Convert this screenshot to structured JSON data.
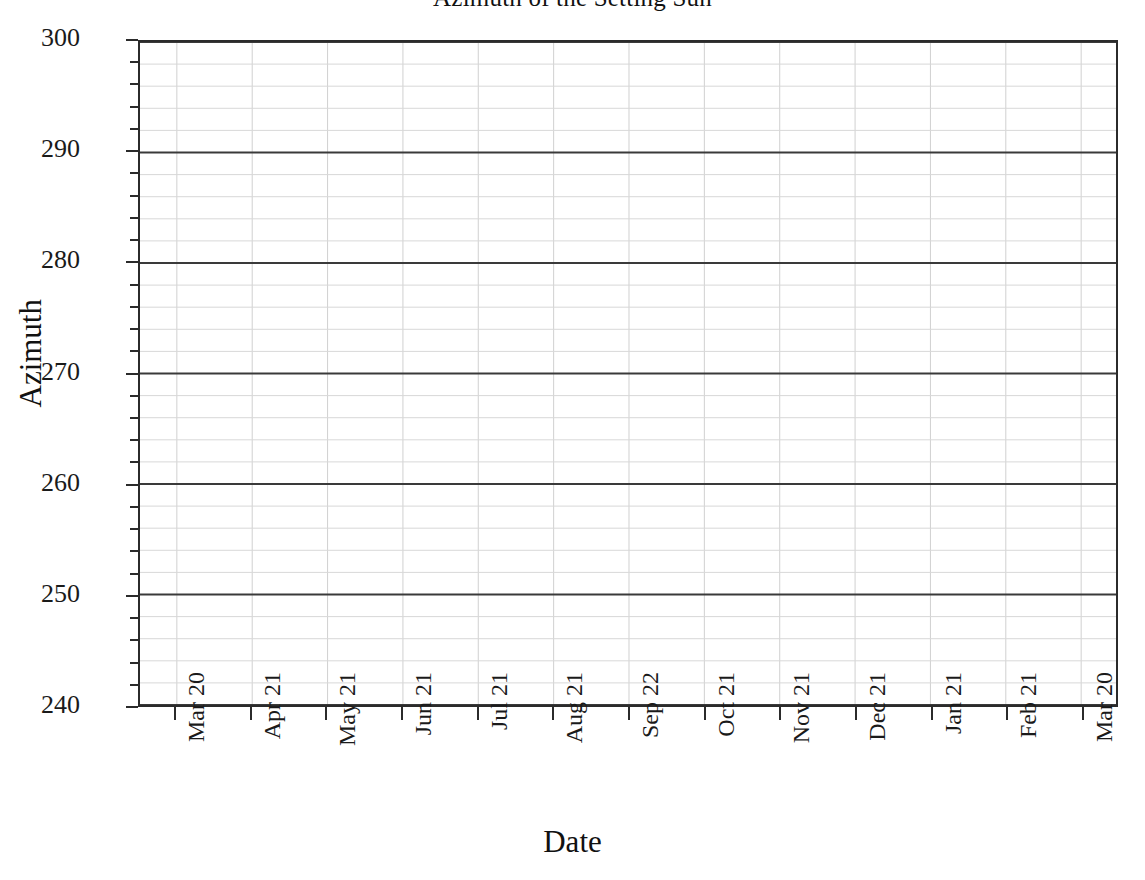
{
  "chart_data": {
    "type": "line",
    "title": "Azimuth of the Setting Sun",
    "xlabel": "Date",
    "ylabel": "Azimuth",
    "grid": true,
    "legend": "none",
    "ylim": [
      240,
      300
    ],
    "y_major_step": 10,
    "y_minor_step": 2,
    "y_ticks": [
      300,
      290,
      280,
      270,
      260,
      250,
      240
    ],
    "y_tick_labels": [
      "300",
      "290",
      "280",
      "270",
      "260",
      "250",
      "240"
    ],
    "x_ticks": [
      0,
      1,
      2,
      3,
      4,
      5,
      6,
      7,
      8,
      9,
      10,
      11,
      12
    ],
    "x_tick_labels": [
      "Mar 20",
      "Apr 21",
      "May 21",
      "Jun 21",
      "Jul 21",
      "Aug 21",
      "Sep 22",
      "Oct 21",
      "Nov 21",
      "Dec 21",
      "Jan 21",
      "Feb 21",
      "Mar 20"
    ],
    "series": [
      {
        "name": "Azimuth of the Setting Sun",
        "x": [],
        "values": []
      }
    ],
    "note": "No data curve is rendered in the visible plot area; only the axes, major gridlines at every 10 units and minor gridlines at every 2 units are drawn."
  },
  "axes": {
    "title": "Azimuth of the Setting Sun",
    "x_axis_title": "Date",
    "y_axis_title": "Azimuth"
  },
  "style": {
    "major_gridline_color": "#3a3a3a",
    "minor_gridline_color": "#d8d8d8",
    "vertical_gridline_color": "#d0d0d0",
    "frame_color": "#2b2b2b",
    "background_color": "#ffffff",
    "text_color": "#1a1a1a"
  }
}
